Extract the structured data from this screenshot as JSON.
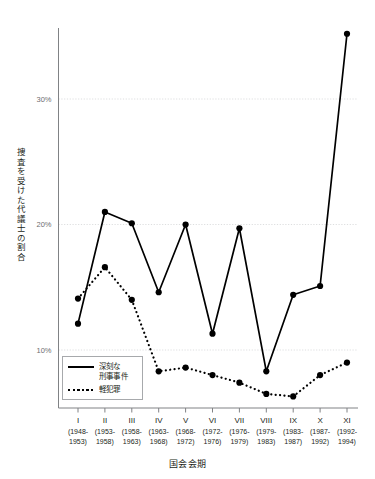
{
  "chart_data": {
    "type": "line",
    "title": "",
    "xlabel": "国会会期",
    "ylabel": "捜査を受けた代議士の割合",
    "ylim": [
      4.5,
      36.5
    ],
    "yticks": [
      10,
      20,
      30
    ],
    "ytick_labels": [
      "10%",
      "20%",
      "30%"
    ],
    "grid": true,
    "grid_axis": "y",
    "legend_position": "bottom-left",
    "categories": [
      "I",
      "II",
      "III",
      "IV",
      "V",
      "VI",
      "VII",
      "VIII",
      "IX",
      "X",
      "XI"
    ],
    "category_sublabels": [
      [
        "(1948-",
        "1953)"
      ],
      [
        "(1953-",
        "1958)"
      ],
      [
        "(1958-",
        "1963)"
      ],
      [
        "(1963-",
        "1968)"
      ],
      [
        "(1968-",
        "1972)"
      ],
      [
        "(1972-",
        "1976)"
      ],
      [
        "(1976-",
        "1979)"
      ],
      [
        "(1979-",
        "1983)"
      ],
      [
        "(1983-",
        "1987)"
      ],
      [
        "(1987-",
        "1992)"
      ],
      [
        "(1992-",
        "1994)"
      ]
    ],
    "series": [
      {
        "name": "深刻な刑事事件",
        "name_lines": [
          "深刻な",
          "刑事事件"
        ],
        "style": "solid",
        "color": "#000000",
        "marker": "circle",
        "values": [
          12.1,
          21.0,
          20.1,
          14.6,
          20.0,
          11.3,
          19.7,
          8.3,
          14.4,
          15.1,
          35.2
        ]
      },
      {
        "name": "軽犯罪",
        "name_lines": [
          "軽犯罪"
        ],
        "style": "dotted",
        "color": "#000000",
        "marker": "circle",
        "values": [
          14.1,
          16.6,
          14.0,
          8.3,
          8.6,
          8.0,
          7.4,
          6.5,
          6.3,
          8.0,
          9.0
        ]
      }
    ]
  },
  "axis": {
    "y_title": "捜査を受けた代議士の割合",
    "x_title": "国会会期",
    "y_tick_labels": [
      "30%",
      "20%",
      "10%"
    ]
  },
  "legend": {
    "entries": [
      {
        "line1": "深刻な",
        "line2": "刑事事件",
        "style": "solid"
      },
      {
        "line1": "軽犯罪",
        "line2": "",
        "style": "dotted"
      }
    ]
  },
  "colors": {
    "ink": "#231f20",
    "axis": "#808285",
    "grid": "#d9dadb",
    "series": "#000000"
  }
}
